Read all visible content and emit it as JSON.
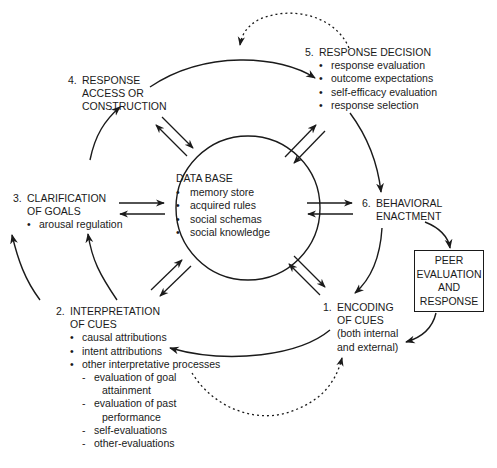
{
  "diagram": {
    "type": "cyclical process model",
    "colors": {
      "ink": "#1a1a1a",
      "background": "#ffffff"
    },
    "center": {
      "title": "DATA BASE",
      "items": [
        "memory store",
        "acquired rules",
        "social schemas",
        "social knowledge"
      ]
    },
    "steps": [
      {
        "number": "1.",
        "title_lines": [
          "ENCODING",
          "OF CUES"
        ],
        "note_lines": [
          "(both internal",
          "and external)"
        ]
      },
      {
        "number": "2.",
        "title_lines": [
          "INTERPRETATION",
          "OF CUES"
        ],
        "bullets": [
          "causal attributions",
          "intent attributions",
          "other interpretative processes"
        ],
        "sub_items": [
          {
            "line1": "evaluation of goal",
            "line2": "attainment"
          },
          {
            "line1": "evaluation of past",
            "line2": "performance"
          },
          {
            "line1": "self-evaluations",
            "line2": ""
          },
          {
            "line1": "other-evaluations",
            "line2": ""
          }
        ]
      },
      {
        "number": "3.",
        "title_lines": [
          "CLARIFICATION",
          "OF GOALS"
        ],
        "bullets": [
          "arousal regulation"
        ]
      },
      {
        "number": "4.",
        "title_lines": [
          "RESPONSE",
          "ACCESS OR",
          "CONSTRUCTION"
        ]
      },
      {
        "number": "5.",
        "title_lines": [
          "RESPONSE DECISION"
        ],
        "bullets": [
          "response evaluation",
          "outcome expectations",
          "self-efficacy evaluation",
          "response selection"
        ]
      },
      {
        "number": "6.",
        "title_lines": [
          "BEHAVIORAL",
          "ENACTMENT"
        ]
      }
    ],
    "peer_box": {
      "lines": [
        "PEER",
        "EVALUATION",
        "AND",
        "RESPONSE"
      ]
    },
    "connections": [
      {
        "from": "1",
        "to": "2",
        "style": "solid"
      },
      {
        "from": "2",
        "to": "3",
        "style": "solid"
      },
      {
        "from": "3",
        "to": "4",
        "style": "solid"
      },
      {
        "from": "4",
        "to": "5",
        "style": "solid"
      },
      {
        "from": "5",
        "to": "6",
        "style": "solid"
      },
      {
        "from": "6",
        "to": "1",
        "style": "solid"
      },
      {
        "from": "6",
        "to": "peer",
        "style": "solid"
      },
      {
        "from": "peer",
        "to": "1",
        "style": "solid"
      },
      {
        "from": "5",
        "to": "4",
        "style": "dotted"
      },
      {
        "from": "2",
        "to": "1",
        "style": "dotted"
      },
      {
        "between": [
          "database",
          "each step"
        ],
        "style": "bidirectional pair"
      }
    ]
  }
}
